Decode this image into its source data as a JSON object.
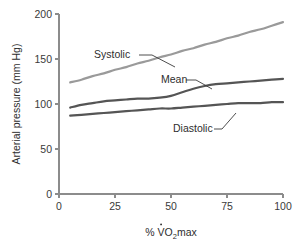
{
  "chart_data": {
    "type": "line",
    "title": "",
    "xlabel": "% V̇O2max",
    "xlabel_parts": {
      "percent": "%",
      "vdot": "V",
      "o": "O",
      "two": "2",
      "max": "max"
    },
    "ylabel": "Arterial pressure (mm Hg)",
    "xlim": [
      0,
      100
    ],
    "ylim": [
      0,
      200
    ],
    "xticks": [
      0,
      25,
      50,
      75,
      100
    ],
    "xtick_labels": [
      "0",
      "25",
      "50",
      "75",
      "100"
    ],
    "yticks": [
      0,
      50,
      100,
      150,
      200
    ],
    "ytick_labels": [
      "0",
      "50",
      "100",
      "150",
      "200"
    ],
    "grid": false,
    "legend_position": "inline-annotations",
    "x": [
      5,
      10,
      15,
      20,
      25,
      30,
      35,
      40,
      45,
      50,
      55,
      60,
      65,
      70,
      75,
      80,
      85,
      90,
      95,
      100
    ],
    "series": [
      {
        "name": "Systolic",
        "color": "#9a9a9a",
        "width": 2.2,
        "values": [
          124,
          127,
          131,
          134,
          138,
          141,
          145,
          148,
          152,
          155,
          159,
          162,
          166,
          169,
          173,
          176,
          180,
          183,
          187,
          191
        ]
      },
      {
        "name": "Mean",
        "color": "#555555",
        "width": 2.2,
        "values": [
          96,
          99,
          101,
          103,
          104,
          105,
          106,
          106,
          107,
          109,
          113,
          117,
          120,
          122,
          123,
          124,
          125,
          126,
          127,
          128
        ]
      },
      {
        "name": "Diastolic",
        "color": "#555555",
        "width": 2.2,
        "values": [
          87,
          88,
          89,
          90,
          91,
          92,
          93,
          94,
          95,
          95,
          96,
          97,
          98,
          99,
          100,
          101,
          101,
          101,
          102,
          102
        ]
      }
    ],
    "annotations": [
      {
        "text": "Systolic",
        "label_x": 94,
        "label_y": 58,
        "leader": "M 139 55 L 152 55 L 175 67"
      },
      {
        "text": "Mean",
        "label_x": 161,
        "label_y": 83,
        "leader": "M 186 80 L 196 80 L 212 89"
      },
      {
        "text": "Diastolic",
        "label_x": 173,
        "label_y": 132,
        "leader": "M 214 129 L 222 129 L 236 113"
      }
    ]
  }
}
